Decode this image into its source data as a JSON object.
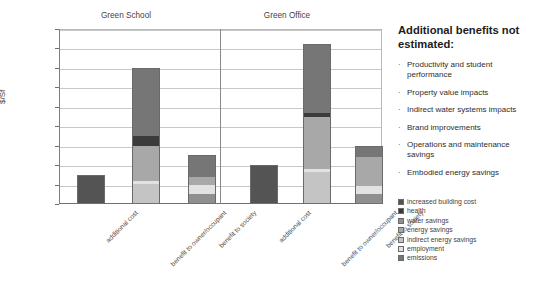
{
  "chart_data": {
    "type": "bar",
    "subtype": "stacked-bar-grouped",
    "title": "",
    "xlabel": "",
    "ylabel": "$/Sf",
    "ylim": [
      0,
      18
    ],
    "ytick_step": 2,
    "ytick_labels": [
      "$0",
      "$2",
      "$4",
      "$6",
      "$8",
      "$10",
      "$12",
      "$14",
      "$16",
      "$18"
    ],
    "grid": true,
    "legend_position": "right-bottom",
    "groups": [
      "Green School",
      "Green Office"
    ],
    "categories": [
      "additional cost",
      "benefit to owner/occupant",
      "benefit to society"
    ],
    "series": [
      {
        "name": "increased building cost",
        "color": "#545454"
      },
      {
        "name": "health",
        "color": "#3b3b3b"
      },
      {
        "name": "water savings",
        "color": "#8f8f8f"
      },
      {
        "name": "energy savings",
        "color": "#a8a8a8"
      },
      {
        "name": "indirect energy savings",
        "color": "#c4c4c4"
      },
      {
        "name": "employment",
        "color": "#e2e2e2"
      },
      {
        "name": "emissions",
        "color": "#767676"
      }
    ],
    "bars": [
      {
        "group": "Green School",
        "category": "additional cost",
        "total": 3.0,
        "segments": [
          {
            "series": "increased building cost",
            "value": 3.0,
            "from": 0.0,
            "to": 3.0,
            "color": "#545454"
          }
        ]
      },
      {
        "group": "Green School",
        "category": "benefit to owner/occupant",
        "total": 14.0,
        "segments": [
          {
            "series": "indirect energy savings",
            "value": 2.1,
            "from": 0.0,
            "to": 2.1,
            "color": "#c4c4c4"
          },
          {
            "series": "employment",
            "value": 0.3,
            "from": 2.1,
            "to": 2.4,
            "color": "#e2e2e2"
          },
          {
            "series": "energy savings",
            "value": 3.6,
            "from": 2.4,
            "to": 6.0,
            "color": "#a8a8a8"
          },
          {
            "series": "health",
            "value": 1.0,
            "from": 6.0,
            "to": 7.0,
            "color": "#3b3b3b"
          },
          {
            "series": "emissions",
            "value": 7.0,
            "from": 7.0,
            "to": 14.0,
            "color": "#767676"
          }
        ]
      },
      {
        "group": "Green School",
        "category": "benefit to society",
        "total": 5.0,
        "segments": [
          {
            "series": "water savings",
            "value": 1.0,
            "from": 0.0,
            "to": 1.0,
            "color": "#8f8f8f"
          },
          {
            "series": "employment",
            "value": 1.0,
            "from": 1.0,
            "to": 2.0,
            "color": "#e2e2e2"
          },
          {
            "series": "energy savings",
            "value": 0.8,
            "from": 2.0,
            "to": 2.8,
            "color": "#a8a8a8"
          },
          {
            "series": "emissions",
            "value": 2.2,
            "from": 2.8,
            "to": 5.0,
            "color": "#767676"
          }
        ]
      },
      {
        "group": "Green Office",
        "category": "additional cost",
        "total": 4.0,
        "segments": [
          {
            "series": "increased building cost",
            "value": 4.0,
            "from": 0.0,
            "to": 4.0,
            "color": "#545454"
          }
        ]
      },
      {
        "group": "Green Office",
        "category": "benefit to owner/occupant",
        "total": 16.5,
        "segments": [
          {
            "series": "indirect energy savings",
            "value": 3.3,
            "from": 0.0,
            "to": 3.3,
            "color": "#c4c4c4"
          },
          {
            "series": "employment",
            "value": 0.3,
            "from": 3.3,
            "to": 3.6,
            "color": "#e2e2e2"
          },
          {
            "series": "energy savings",
            "value": 5.3,
            "from": 3.6,
            "to": 8.9,
            "color": "#a8a8a8"
          },
          {
            "series": "health",
            "value": 0.5,
            "from": 8.9,
            "to": 9.4,
            "color": "#3b3b3b"
          },
          {
            "series": "emissions",
            "value": 7.1,
            "from": 9.4,
            "to": 16.5,
            "color": "#767676"
          }
        ]
      },
      {
        "group": "Green Office",
        "category": "benefit to society",
        "total": 6.0,
        "segments": [
          {
            "series": "water savings",
            "value": 1.0,
            "from": 0.0,
            "to": 1.0,
            "color": "#8f8f8f"
          },
          {
            "series": "employment",
            "value": 0.9,
            "from": 1.0,
            "to": 1.9,
            "color": "#e2e2e2"
          },
          {
            "series": "energy savings",
            "value": 2.9,
            "from": 1.9,
            "to": 4.8,
            "color": "#a8a8a8"
          },
          {
            "series": "emissions",
            "value": 1.2,
            "from": 4.8,
            "to": 6.0,
            "color": "#767676"
          }
        ]
      }
    ]
  },
  "sidepanel": {
    "heading": "Additional benefits not estimated:",
    "bullet_char": "·",
    "bullets": [
      "Productivity and student performance",
      "Property value impacts",
      "Indirect water systems impacts",
      "Brand improvements",
      "Operations and maintenance savings",
      "Embodied energy savings"
    ]
  }
}
